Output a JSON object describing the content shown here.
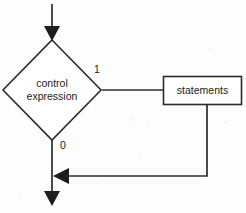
{
  "figure": {
    "kind": "flowchart",
    "background_color": "#fdfdfd",
    "stroke_color": "#2b2b2b",
    "text_color": "#1c1c1c"
  },
  "nodes": {
    "decision": {
      "shape": "diamond",
      "label_line1": "control",
      "label_line2": "expression",
      "center_x": 52,
      "center_y": 90,
      "half_width": 49,
      "half_height": 50
    },
    "process": {
      "shape": "rectangle",
      "label": "statements",
      "x": 163,
      "y": 76,
      "width": 79,
      "height": 29
    }
  },
  "edges": {
    "entry": {
      "name": "entry-arrow",
      "from": "top",
      "to": "decision",
      "label": ""
    },
    "true_branch": {
      "name": "true-branch",
      "label": "1",
      "label_x": 97,
      "label_y": 70,
      "from": "decision-right",
      "to": "process-left"
    },
    "false_branch": {
      "name": "false-branch",
      "label": "0",
      "label_x": 63,
      "label_y": 146,
      "from": "decision-bottom",
      "to": "exit"
    },
    "loop_back": {
      "name": "loop-back-edge",
      "label": "",
      "from": "process-bottom",
      "to": "false-branch-line"
    },
    "exit": {
      "name": "exit-arrow",
      "label": ""
    }
  },
  "geometry": {
    "entry_line": "M52,4 L52,34",
    "entry_arrow_points": "52,41 44,26 60,26",
    "true_line": "M102,90 L196,90",
    "true_arrow_points": "203,90 187,82 187,98",
    "false_line": "M52,140 L52,199",
    "exit_arrow_points": "52,206 44,191 60,191",
    "loop_line": "M207,105 L207,176 L61,176",
    "loop_arrow_points": "53,176 69,168 69,184",
    "diamond_points": "52,40 101,90 52,140 3,90",
    "rect": {
      "x": 163.5,
      "y": 76.5,
      "w": 78,
      "h": 28
    }
  },
  "specks": [
    {
      "left": 129,
      "top": 118,
      "size": 3
    },
    {
      "left": 146,
      "top": 120,
      "size": 2
    },
    {
      "left": 224,
      "top": 121,
      "size": 3
    },
    {
      "left": 138,
      "top": 156,
      "size": 2
    },
    {
      "left": 18,
      "top": 196,
      "size": 2
    },
    {
      "left": 208,
      "top": 48,
      "size": 2
    },
    {
      "left": 96,
      "top": 182,
      "size": 2
    }
  ]
}
